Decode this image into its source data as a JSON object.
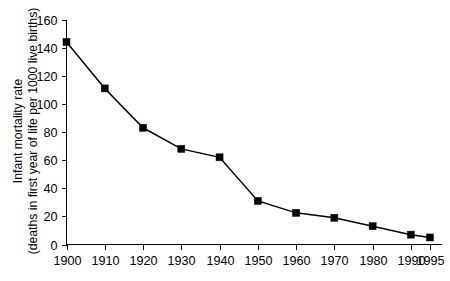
{
  "chart_data": {
    "type": "line",
    "title": "",
    "subtitle": "",
    "xlabel": "",
    "ylabel_line1": "Infant mortality rate",
    "ylabel_line2": "(deaths in first year of life per 1000 live births)",
    "x": [
      1900,
      1910,
      1920,
      1930,
      1940,
      1950,
      1960,
      1970,
      1980,
      1990,
      1995
    ],
    "categories": [
      "1900",
      "1910",
      "1920",
      "1930",
      "1940",
      "1950",
      "1960",
      "1970",
      "1980",
      "1990",
      "1995"
    ],
    "values": [
      144,
      111,
      83,
      68,
      62,
      31,
      22.5,
      19,
      13,
      7,
      5
    ],
    "series": [
      {
        "name": "Infant mortality rate",
        "values": [
          144,
          111,
          83,
          68,
          62,
          31,
          22.5,
          19,
          13,
          7,
          5
        ]
      }
    ],
    "xtick_labels": [
      "1900",
      "1910",
      "1920",
      "1930",
      "1940",
      "1950",
      "1960",
      "1970",
      "1980",
      "1990",
      "1995"
    ],
    "ytick_labels": [
      "0",
      "20",
      "40",
      "60",
      "80",
      "100",
      "120",
      "140",
      "160"
    ],
    "yticks": [
      0,
      20,
      40,
      60,
      80,
      100,
      120,
      140,
      160
    ],
    "ylim": [
      0,
      160
    ],
    "xlim": [
      1900,
      1998
    ],
    "grid": false,
    "legend": false,
    "legend_position": "none",
    "marker": "square",
    "line_color": "#000000",
    "marker_color": "#000000",
    "background_color": "#ffffff"
  }
}
